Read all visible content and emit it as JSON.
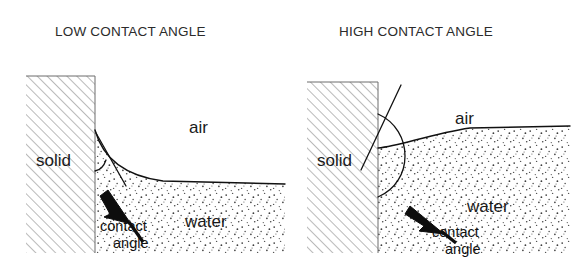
{
  "figure": {
    "caption_absent": true,
    "background_color": "#ffffff",
    "ink_color": "#111111",
    "hatch_color": "#9b9b9b",
    "stipple_color": "#4d4d4d"
  },
  "panels": [
    {
      "id": "low",
      "title": "LOW CONTACT ANGLE",
      "title_x": 55,
      "title_y": 36,
      "regions": [
        {
          "name": "solid",
          "label": "solid",
          "label_x": 36,
          "label_y": 166,
          "fill": "hatch"
        },
        {
          "name": "air",
          "label": "air",
          "label_x": 189,
          "label_y": 133,
          "fill": "white"
        },
        {
          "name": "water",
          "label": "water",
          "label_x": 185,
          "label_y": 227,
          "fill": "stipple"
        }
      ],
      "callout": {
        "line1": "contact",
        "line2": "angle",
        "line1_x": 100,
        "line1_y": 231,
        "line2_x": 113,
        "line2_y": 248,
        "arrow_from": [
          127,
          222
        ],
        "arrow_to": [
          105,
          188
        ]
      },
      "solid_block": {
        "x": 26,
        "y": 76,
        "width": 69,
        "height": 177
      },
      "wall_x": 95,
      "water_level_right_y": 184,
      "contact_point": [
        95,
        130
      ],
      "meniscus": "M95,130 C101,152 118,175 163,181 L285,184"
    },
    {
      "id": "high",
      "title": "HIGH CONTACT ANGLE",
      "title_x": 339,
      "title_y": 36,
      "regions": [
        {
          "name": "solid",
          "label": "solid",
          "label_x": 317,
          "label_y": 166,
          "fill": "hatch"
        },
        {
          "name": "air",
          "label": "air",
          "label_x": 455,
          "label_y": 124,
          "fill": "white"
        },
        {
          "name": "water",
          "label": "water",
          "label_x": 467,
          "label_y": 212,
          "fill": "stipple"
        }
      ],
      "callout": {
        "line1": "contact",
        "line2": "angle",
        "line1_x": 432,
        "line1_y": 237,
        "line2_x": 445,
        "line2_y": 254,
        "arrow_from": [
          440,
          232
        ],
        "arrow_to": [
          410,
          208
        ]
      },
      "solid_block": {
        "x": 307,
        "y": 82,
        "width": 71,
        "height": 171
      },
      "wall_x": 378,
      "water_level_right_y": 126,
      "contact_point": [
        378,
        148
      ],
      "meniscus": "M378,148 C400,146 430,134 470,128 L570,126",
      "tangent_line": [
        [
          362,
          168
        ],
        [
          400,
          86
        ]
      ],
      "angle_arc": "M378,115 C412,130 412,180 378,196"
    }
  ]
}
